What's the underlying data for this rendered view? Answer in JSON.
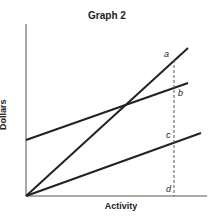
{
  "title": "Graph 2",
  "xlabel": "Activity",
  "ylabel": "Dollars",
  "points": {
    "a": "a",
    "b": "b",
    "c": "c",
    "d": "d"
  },
  "colors": {
    "line": "#222222",
    "axis": "#555555"
  }
}
